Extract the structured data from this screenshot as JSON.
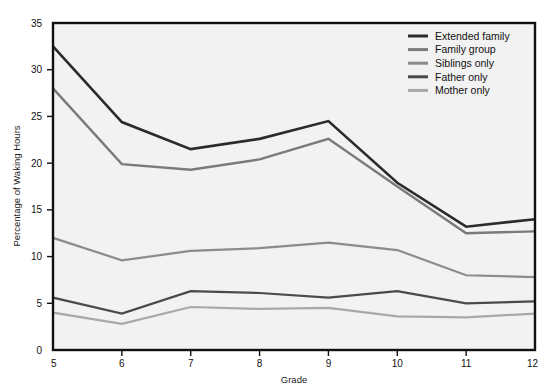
{
  "chart_data": {
    "type": "line",
    "title": "",
    "xlabel": "Grade",
    "ylabel": "Percentage of Waking Hours",
    "categories": [
      5,
      6,
      7,
      8,
      9,
      10,
      11,
      12
    ],
    "x": [
      5,
      6,
      7,
      8,
      9,
      10,
      11,
      12
    ],
    "xlim": [
      5,
      12
    ],
    "ylim": [
      0,
      35
    ],
    "xticks": [
      "5",
      "6",
      "7",
      "8",
      "9",
      "10",
      "11",
      "12"
    ],
    "yticks": [
      "0",
      "5",
      "10",
      "15",
      "20",
      "25",
      "30",
      "35"
    ],
    "grid": false,
    "legend_position": "top-right",
    "series": [
      {
        "name": "Extended family",
        "color": "#2b2b2b",
        "width": 2.6,
        "values": [
          32.5,
          24.4,
          21.5,
          22.6,
          24.5,
          17.9,
          13.2,
          14.0
        ]
      },
      {
        "name": "Family group",
        "color": "#7a7a7a",
        "width": 2.4,
        "values": [
          28.0,
          19.9,
          19.3,
          20.4,
          22.6,
          17.5,
          12.5,
          12.7
        ]
      },
      {
        "name": "Siblings only",
        "color": "#8c8c8c",
        "width": 2.2,
        "values": [
          12.0,
          9.6,
          10.6,
          10.9,
          11.5,
          10.7,
          8.0,
          7.8
        ]
      },
      {
        "name": "Father only",
        "color": "#4a4a4a",
        "width": 2.2,
        "values": [
          5.6,
          3.9,
          6.3,
          6.1,
          5.6,
          6.3,
          5.0,
          5.2
        ]
      },
      {
        "name": "Mother only",
        "color": "#a8a8a8",
        "width": 2.2,
        "values": [
          4.0,
          2.8,
          4.6,
          4.4,
          4.5,
          3.6,
          3.5,
          3.9
        ]
      }
    ]
  },
  "legend": {
    "items": [
      {
        "label": "Extended family",
        "color": "#2b2b2b"
      },
      {
        "label": "Family group",
        "color": "#7a7a7a"
      },
      {
        "label": "Siblings only",
        "color": "#8c8c8c"
      },
      {
        "label": "Father only",
        "color": "#4a4a4a"
      },
      {
        "label": "Mother only",
        "color": "#a8a8a8"
      }
    ]
  },
  "style": {
    "plot_background": "#f2f2f2",
    "frame_color": "#111111",
    "page_background": "#ffffff"
  }
}
